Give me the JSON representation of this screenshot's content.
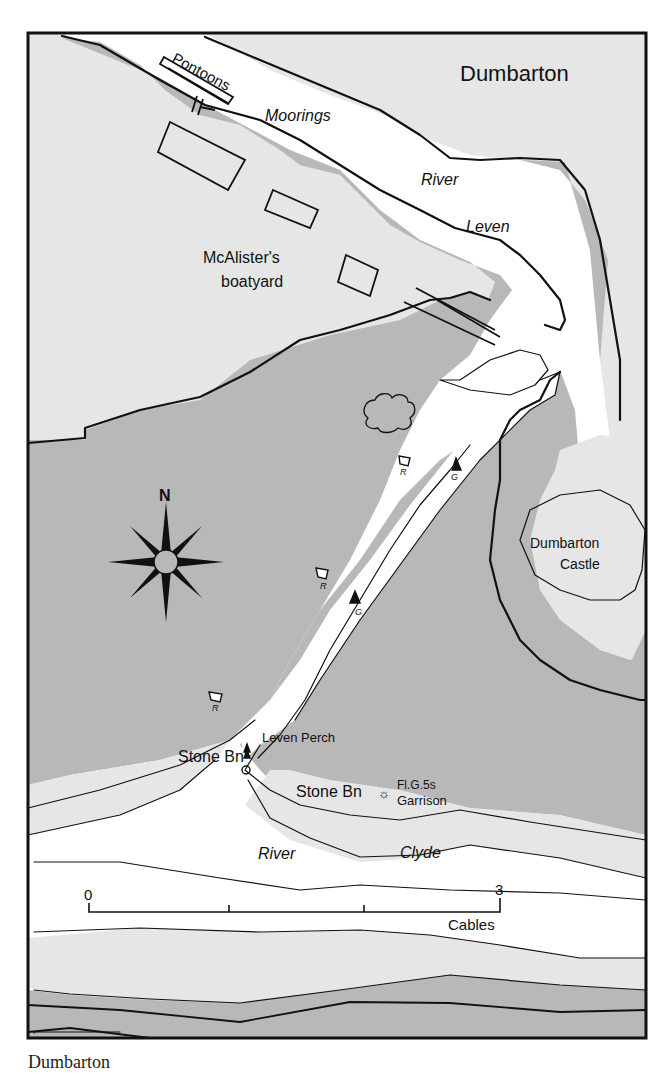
{
  "map": {
    "title": "Dumbarton",
    "caption": "Dumbarton",
    "colors": {
      "land": "#e6e6e6",
      "drying": "#b8b8b8",
      "water": "#ffffff",
      "line": "#111111"
    },
    "labels": {
      "pontoons": "Pontoons",
      "moorings": "Moorings",
      "river_leven_1": "River",
      "river_leven_2": "Leven",
      "boatyard_1": "McAlister's",
      "boatyard_2": "boatyard",
      "castle_1": "Dumbarton",
      "castle_2": "Castle",
      "leven_perch": "Leven Perch",
      "stone_bn_1": "Stone Bn",
      "stone_bn_2": "Stone Bn",
      "light_char": "Fl.G.5s",
      "garrison": "Garrison",
      "river_clyde_1": "River",
      "river_clyde_2": "Clyde",
      "north": "N"
    },
    "buoys": [
      {
        "type": "red-can",
        "label": "R"
      },
      {
        "type": "red-can",
        "label": "R"
      },
      {
        "type": "red-can",
        "label": "R"
      },
      {
        "type": "green-cone",
        "label": "G"
      },
      {
        "type": "green-cone",
        "label": "G"
      }
    ],
    "scale_bar": {
      "start_label": "0",
      "end_label": "3",
      "unit": "Cables",
      "divisions": 3
    }
  }
}
